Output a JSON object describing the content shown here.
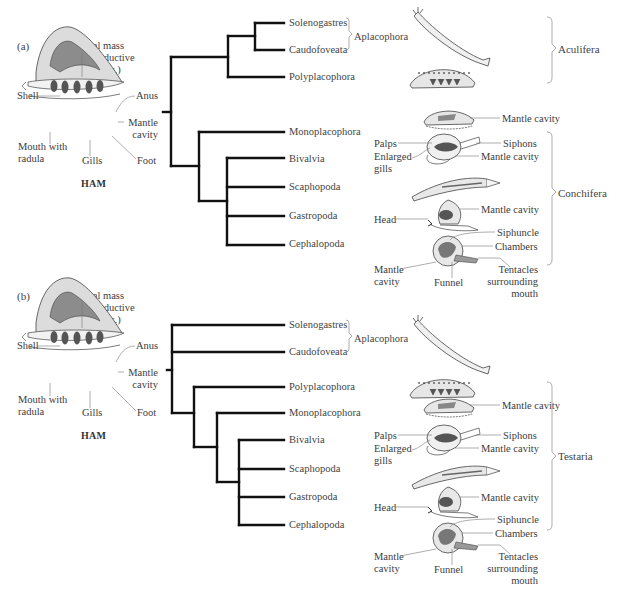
{
  "panels": [
    {
      "letter": "(a)",
      "ham": {
        "title": "HAM",
        "visceral_mass": [
          "Visceral mass",
          "(guts, reproductive",
          "organs, etc.)"
        ],
        "shell": "Shell",
        "anus": "Anus",
        "mantle_cavity": [
          "Mantle",
          "cavity"
        ],
        "mouth": [
          "Mouth with",
          "radula"
        ],
        "gills": "Gills",
        "foot": "Foot"
      },
      "taxa": [
        "Solenogastres",
        "Caudofoveata",
        "Polyplacophora",
        "Monoplacophora",
        "Bivalvia",
        "Scaphopoda",
        "Gastropoda",
        "Cephalopoda"
      ],
      "subgroup": "Aplacophora",
      "clades": [
        "Aculifera",
        "Conchifera"
      ],
      "annotations": {
        "monoplac_mantle": "Mantle cavity",
        "palps": "Palps",
        "enlarged_gills": [
          "Enlarged",
          "gills"
        ],
        "siphons": "Siphons",
        "bivalve_mantle": "Mantle cavity",
        "head": "Head",
        "gastro_mantle": "Mantle cavity",
        "siphuncle": "Siphuncle",
        "chambers": "Chambers",
        "ceph_mantle": [
          "Mantle",
          "cavity"
        ],
        "funnel": "Funnel",
        "tentacles": [
          "Tentacles",
          "surrounding",
          "mouth"
        ]
      }
    },
    {
      "letter": "(b)",
      "ham": {
        "title": "HAM",
        "visceral_mass": [
          "Visceral mass",
          "(guts, reproductive",
          "organs, etc.)"
        ],
        "shell": "Shell",
        "anus": "Anus",
        "mantle_cavity": [
          "Mantle",
          "cavity"
        ],
        "mouth": [
          "Mouth with",
          "radula"
        ],
        "gills": "Gills",
        "foot": "Foot"
      },
      "taxa": [
        "Solenogastres",
        "Caudofoveata",
        "Polyplacophora",
        "Monoplacophora",
        "Bivalvia",
        "Scaphopoda",
        "Gastropoda",
        "Cephalopoda"
      ],
      "subgroup": "Aplacophora",
      "clades": [
        "Testaria"
      ],
      "annotations": {
        "monoplac_mantle": "Mantle cavity",
        "palps": "Palps",
        "enlarged_gills": [
          "Enlarged",
          "gills"
        ],
        "siphons": "Siphons",
        "bivalve_mantle": "Mantle cavity",
        "head": "Head",
        "gastro_mantle": "Mantle cavity",
        "siphuncle": "Siphuncle",
        "chambers": "Chambers",
        "ceph_mantle": [
          "Mantle",
          "cavity"
        ],
        "funnel": "Funnel",
        "tentacles": [
          "Tentacles",
          "surrounding",
          "mouth"
        ]
      }
    }
  ],
  "colors": {
    "branch": "#111111",
    "leader": "#777777",
    "bracket": "#999999",
    "shell_fill": "#d9d9d9",
    "visceral_fill": "#8a8a8a",
    "gill_fill": "#555555"
  }
}
